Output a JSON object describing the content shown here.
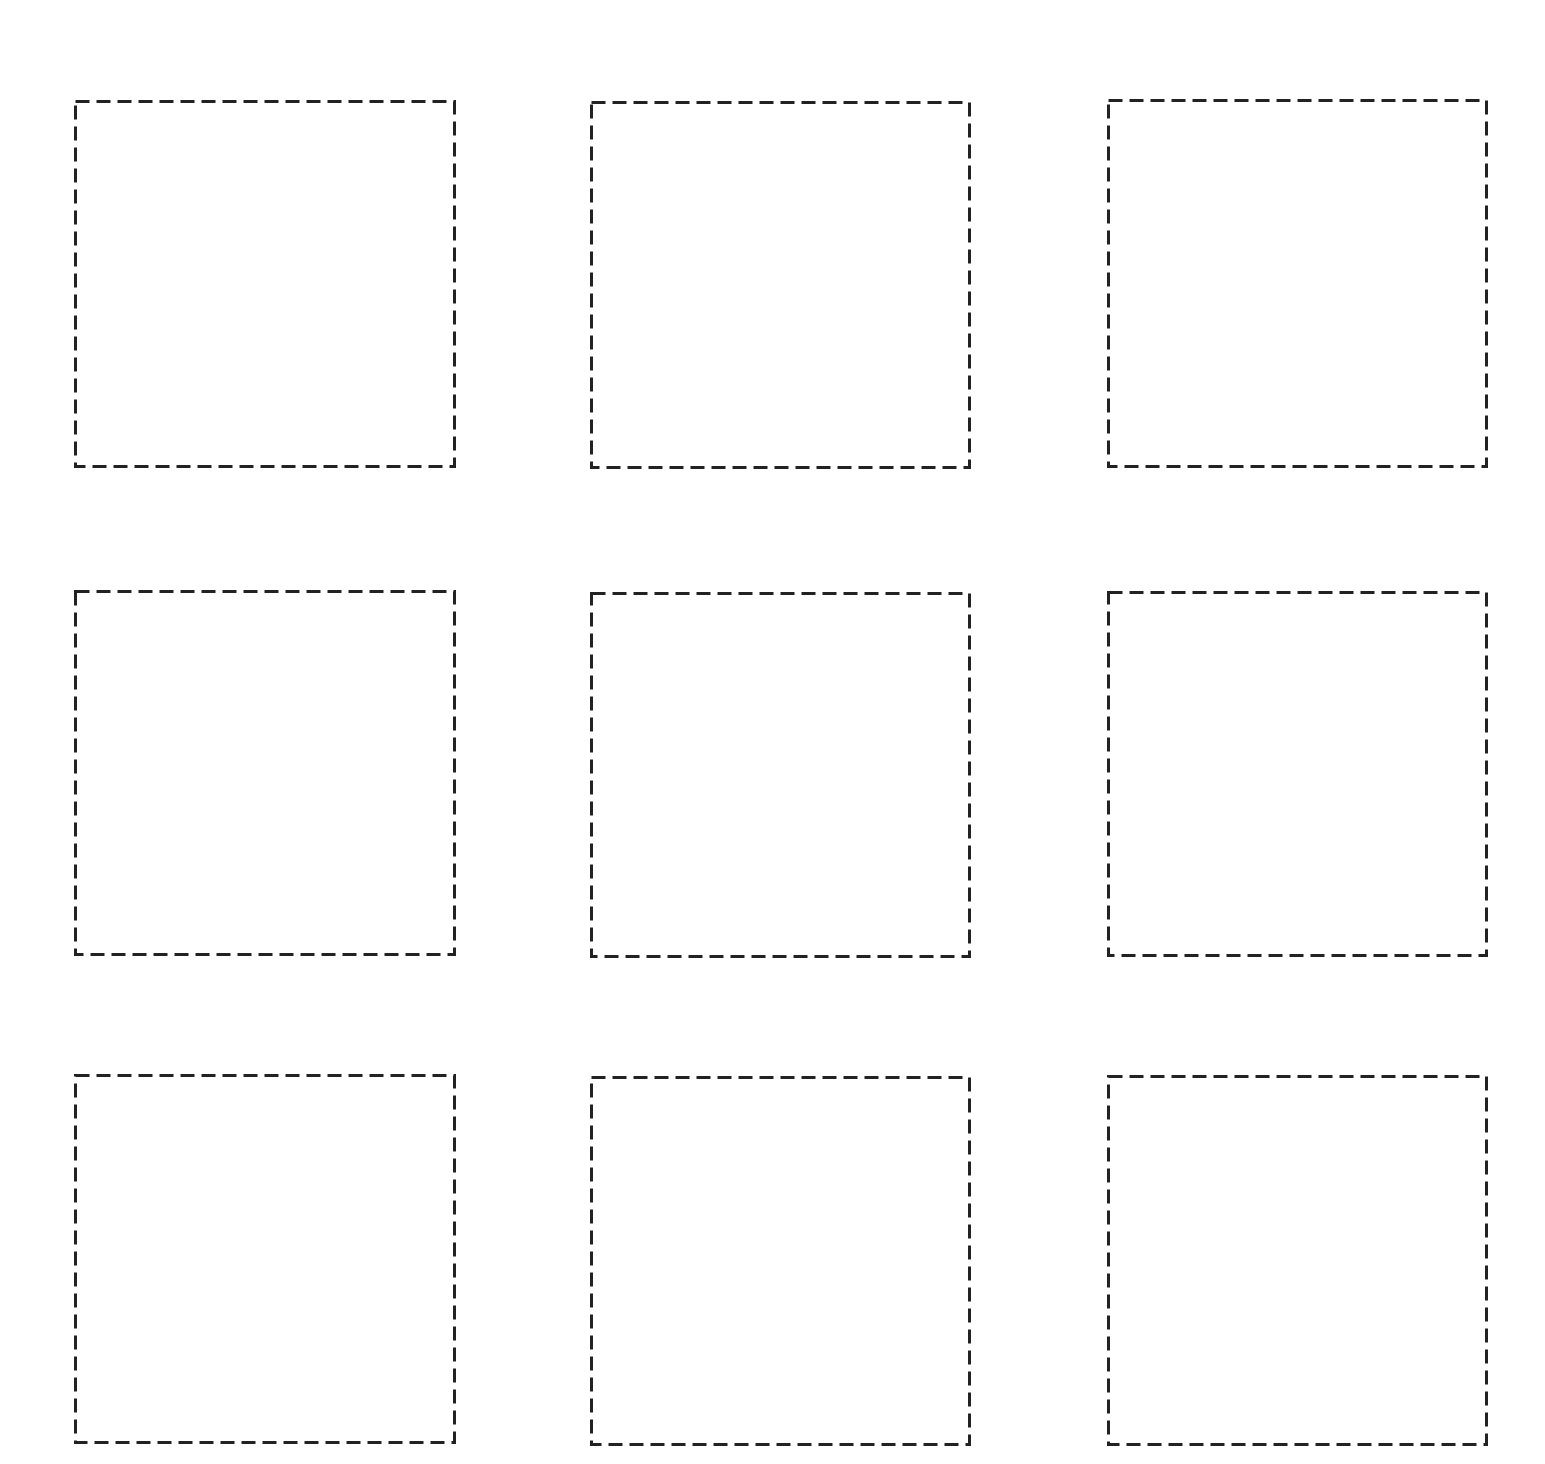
{
  "page": {
    "background": "#ffffff",
    "stroke_color": "#222222",
    "stroke_width": 3,
    "dash": [
      14,
      7
    ]
  },
  "grid": {
    "rows": 3,
    "columns": 3,
    "boxes": [
      {
        "row": 1,
        "col": 1,
        "x": 74,
        "y": 100,
        "w": 382,
        "h": 368
      },
      {
        "row": 1,
        "col": 2,
        "x": 590,
        "y": 101,
        "w": 381,
        "h": 368
      },
      {
        "row": 1,
        "col": 3,
        "x": 1107,
        "y": 99,
        "w": 381,
        "h": 369
      },
      {
        "row": 2,
        "col": 1,
        "x": 74,
        "y": 590,
        "w": 382,
        "h": 366
      },
      {
        "row": 2,
        "col": 2,
        "x": 590,
        "y": 592,
        "w": 381,
        "h": 366
      },
      {
        "row": 2,
        "col": 3,
        "x": 1107,
        "y": 591,
        "w": 381,
        "h": 366
      },
      {
        "row": 3,
        "col": 1,
        "x": 74,
        "y": 1074,
        "w": 382,
        "h": 370
      },
      {
        "row": 3,
        "col": 2,
        "x": 590,
        "y": 1076,
        "w": 381,
        "h": 370
      },
      {
        "row": 3,
        "col": 3,
        "x": 1107,
        "y": 1075,
        "w": 381,
        "h": 371
      }
    ]
  }
}
